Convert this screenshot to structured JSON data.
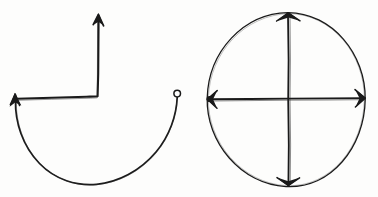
{
  "canvas": {
    "title": "Hand-drawn arrow sketch",
    "width": 378,
    "height": 197,
    "background_color": "#fdfdfc",
    "ink_color": "#1a1a1a",
    "style": "hand-drawn pen sketch, no text labels"
  },
  "figures": [
    {
      "id": "figure-left",
      "name": "semicircle-with-corner-arrow",
      "description": "An open semicircular arc with an arrowhead at its upper-left end and a small open circle at its upper-right end, plus an L-shaped polyline whose arms end in arrowheads",
      "parts": [
        {
          "name": "semicircle-arc",
          "type": "arc",
          "start": [
            15,
            100
          ],
          "bottom": [
            96,
            184
          ],
          "end": [
            177,
            96
          ],
          "open_side": "up"
        },
        {
          "name": "arc-arrowhead-left",
          "type": "arrowhead",
          "at": [
            15,
            98
          ],
          "direction": "up"
        },
        {
          "name": "arc-endpoint-dot",
          "type": "open-circle",
          "at": [
            177,
            94
          ],
          "radius": 3.2
        },
        {
          "name": "corner-polyline",
          "type": "polyline",
          "points": [
            [
              17,
              99
            ],
            [
              98,
              96
            ],
            [
              98,
              16
            ]
          ]
        },
        {
          "name": "polyline-arrowhead-top",
          "type": "arrowhead",
          "at": [
            98,
            14
          ],
          "direction": "up"
        },
        {
          "name": "polyline-arrowhead-left",
          "type": "arrowhead",
          "at": [
            15,
            97
          ],
          "direction": "up-left"
        }
      ]
    },
    {
      "id": "figure-right",
      "name": "circle-with-crossed-diameters",
      "description": "A circle with a vertical and a horizontal diameter drawn through the center; each diameter terminates in arrowheads on the circle, and a filled dot marks the left intersection",
      "parts": [
        {
          "name": "circle-outline",
          "type": "ellipse",
          "center": [
            286,
            99
          ],
          "radius_x": 80,
          "radius_y": 87
        },
        {
          "name": "vertical-diameter",
          "type": "line",
          "from": [
            288,
            14
          ],
          "to": [
            288,
            185
          ]
        },
        {
          "name": "horizontal-diameter",
          "type": "line",
          "from": [
            207,
            99
          ],
          "to": [
            365,
            98
          ]
        },
        {
          "name": "arrowhead-top",
          "type": "arrowhead",
          "at": [
            288,
            14
          ],
          "direction": "up"
        },
        {
          "name": "arrowhead-bottom",
          "type": "arrowhead",
          "at": [
            288,
            185
          ],
          "direction": "down"
        },
        {
          "name": "arrowhead-left",
          "type": "arrowhead",
          "at": [
            207,
            99
          ],
          "direction": "left"
        },
        {
          "name": "arrowhead-right",
          "type": "arrowhead",
          "at": [
            365,
            98
          ],
          "direction": "right"
        },
        {
          "name": "left-center-dot",
          "type": "filled-dot",
          "at": [
            209,
            99
          ],
          "radius": 3
        }
      ]
    }
  ]
}
